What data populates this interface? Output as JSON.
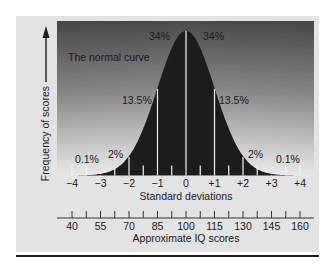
{
  "chart_data": {
    "type": "area",
    "title": "The normal curve",
    "xlabel": "Standard deviations",
    "ylabel": "Frequency of scores",
    "secondary_xlabel": "Approximate IQ scores",
    "x_ticks": [
      "−4",
      "−3",
      "−2",
      "−1",
      "0",
      "+1",
      "+2",
      "+3",
      "+4"
    ],
    "x_values": [
      -4,
      -3,
      -2,
      -1,
      0,
      1,
      2,
      3,
      4
    ],
    "iq_ticks": [
      "40",
      "55",
      "70",
      "85",
      "100",
      "115",
      "130",
      "145",
      "160"
    ],
    "xlim": [
      -4,
      4
    ],
    "regions": [
      {
        "range": [
          -4,
          -3
        ],
        "label": "0.1%",
        "value": 0.1
      },
      {
        "range": [
          -3,
          -2
        ],
        "label": "2%",
        "value": 2
      },
      {
        "range": [
          -2,
          -1
        ],
        "label": "13.5%",
        "value": 13.5
      },
      {
        "range": [
          -1,
          0
        ],
        "label": "34%",
        "value": 34
      },
      {
        "range": [
          0,
          1
        ],
        "label": "34%",
        "value": 34
      },
      {
        "range": [
          1,
          2
        ],
        "label": "13.5%",
        "value": 13.5
      },
      {
        "range": [
          2,
          3
        ],
        "label": "2%",
        "value": 2
      },
      {
        "range": [
          3,
          4
        ],
        "label": "0.1%",
        "value": 0.1
      }
    ],
    "grid": false,
    "legend": null
  },
  "labels": {
    "curve_title": "The normal curve",
    "y_axis": "Frequency of scores",
    "sd_axis": "Standard deviations",
    "iq_axis": "Approximate IQ scores",
    "pct_34_left": "34%",
    "pct_34_right": "34%",
    "pct_13_left": "13.5%",
    "pct_13_right": "13.5%",
    "pct_2_left": "2%",
    "pct_2_right": "2%",
    "pct_01_left": "0.1%",
    "pct_01_right": "0.1%"
  },
  "colors": {
    "curve_fill": "#1c1c1c",
    "plot_bg_top": "#4a4a4a",
    "plot_bg_bottom": "#f0f0f0",
    "frame_bg": "#e3e3e3",
    "divider_lines": "#f2f2f2"
  }
}
